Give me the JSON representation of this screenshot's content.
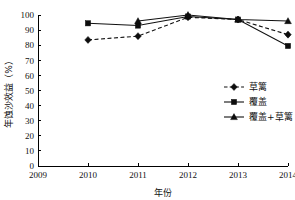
{
  "chart_data": {
    "type": "line",
    "title": "",
    "xlabel": "年份",
    "ylabel": "年蚀沙效益（%）",
    "x": [
      2009,
      2010,
      2011,
      2012,
      2013,
      2014
    ],
    "xtick_labels": [
      "2009",
      "2010",
      "2011",
      "2012",
      "2013",
      "2014"
    ],
    "ytick_labels": [
      "0",
      "10",
      "20",
      "30",
      "40",
      "50",
      "60",
      "70",
      "80",
      "90",
      "100"
    ],
    "yticks": [
      0,
      10,
      20,
      30,
      40,
      50,
      60,
      70,
      80,
      90,
      100
    ],
    "ylim": [
      0,
      100
    ],
    "xlim": [
      2009,
      2014
    ],
    "grid": false,
    "legend_position": "center-right",
    "series": [
      {
        "name": "草篱",
        "marker": "diamond",
        "linestyle": "dashed",
        "color": "#111111",
        "x": [
          2010,
          2011,
          2012,
          2013,
          2014
        ],
        "values": [
          83.5,
          86.0,
          98.5,
          97.0,
          87.0
        ]
      },
      {
        "name": "覆盖",
        "marker": "square",
        "linestyle": "solid",
        "color": "#111111",
        "x": [
          2010,
          2011,
          2012,
          2013,
          2014
        ],
        "values": [
          94.5,
          93.0,
          99.0,
          97.0,
          79.5
        ]
      },
      {
        "name": "覆盖+草篱",
        "marker": "triangle",
        "linestyle": "solid",
        "color": "#111111",
        "x": [
          2011,
          2012,
          2013,
          2014
        ],
        "values": [
          96.0,
          100.0,
          97.0,
          96.0
        ]
      }
    ]
  }
}
